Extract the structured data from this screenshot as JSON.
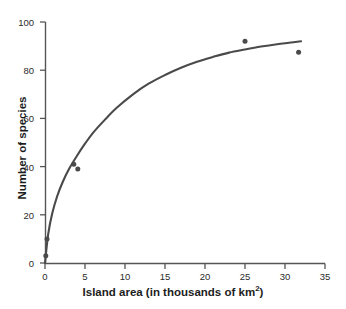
{
  "chart_data": {
    "type": "scatter",
    "title": "",
    "xlabel": "Island area (in thousands of km",
    "xlabel_sup": "2",
    "xlabel_tail": ")",
    "xlabel_full": "Island area (in thousands of km2)",
    "ylabel": "Number of species",
    "xlim": [
      0,
      35
    ],
    "ylim": [
      0,
      100
    ],
    "xticks": [
      0,
      5,
      10,
      15,
      20,
      25,
      30,
      35
    ],
    "yticks": [
      0,
      20,
      40,
      60,
      80,
      100
    ],
    "xtick_labels": [
      "0",
      "5",
      "10",
      "15",
      "20",
      "25",
      "30",
      "35"
    ],
    "ytick_labels": [
      "0",
      "20",
      "40",
      "60",
      "80",
      "100"
    ],
    "grid": false,
    "legend": null,
    "point_color": "#4a4a4a",
    "line_color": "#4a4a4a",
    "axis_color": "#555555",
    "points": [
      {
        "x": 0.1,
        "y": 3
      },
      {
        "x": 0.25,
        "y": 10
      },
      {
        "x": 3.6,
        "y": 41
      },
      {
        "x": 4.1,
        "y": 39
      },
      {
        "x": 25.0,
        "y": 92
      },
      {
        "x": 31.7,
        "y": 87.5
      }
    ],
    "series": [
      {
        "name": "fitted curve",
        "x": [
          0.0,
          0.4,
          0.9,
          1.5,
          2.2,
          3.0,
          4.0,
          5.0,
          6.0,
          7.5,
          9.0,
          11.0,
          13.0,
          15.0,
          17.0,
          19.0,
          21.0,
          23.0,
          25.0,
          27.0,
          29.0,
          30.5,
          32.0
        ],
        "y": [
          0.0,
          12.0,
          20.5,
          27.5,
          33.5,
          39.0,
          44.5,
          49.5,
          54.0,
          59.5,
          64.5,
          70.0,
          74.5,
          78.0,
          81.0,
          83.5,
          85.5,
          87.3,
          88.6,
          89.8,
          90.8,
          91.4,
          92.0
        ]
      }
    ]
  },
  "axes": {
    "x_title_text": "Island area (in thousands of km",
    "x_title_sup": "2",
    "x_title_close": ")",
    "y_title_text": "Number of species"
  }
}
